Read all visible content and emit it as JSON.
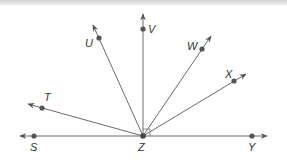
{
  "diagram": {
    "type": "rays-from-common-vertex",
    "vertex": {
      "label": "Z",
      "x": 143,
      "y": 136
    },
    "line": {
      "name": "line SY",
      "through": [
        "S",
        "Z",
        "Y"
      ]
    },
    "right_angle_marker": {
      "between": [
        "ZV",
        "ZY"
      ]
    },
    "rays": [
      {
        "name": "ray-ZS",
        "label": "S",
        "point": [
          34,
          136
        ],
        "tip": [
          20,
          136
        ],
        "label_pos": [
          30,
          151
        ]
      },
      {
        "name": "ray-ZT",
        "label": "T",
        "point": [
          42,
          108
        ],
        "tip": [
          28,
          104
        ],
        "label_pos": [
          44,
          101
        ]
      },
      {
        "name": "ray-ZU",
        "label": "U",
        "point": [
          99,
          38
        ],
        "tip": [
          93,
          25
        ],
        "label_pos": [
          85,
          47
        ]
      },
      {
        "name": "ray-ZV",
        "label": "V",
        "point": [
          143,
          29
        ],
        "tip": [
          143,
          14
        ],
        "label_pos": [
          148,
          33
        ]
      },
      {
        "name": "ray-ZW",
        "label": "W",
        "point": [
          202,
          49
        ],
        "tip": [
          211,
          36
        ],
        "label_pos": [
          187,
          50
        ]
      },
      {
        "name": "ray-ZX",
        "label": "X",
        "point": [
          234,
          81
        ],
        "tip": [
          246,
          74
        ],
        "label_pos": [
          225,
          78
        ]
      },
      {
        "name": "ray-ZY",
        "label": "Y",
        "point": [
          252,
          136
        ],
        "tip": [
          267,
          136
        ],
        "label_pos": [
          248,
          151
        ]
      }
    ],
    "labels": {
      "S": "S",
      "T": "T",
      "U": "U",
      "V": "V",
      "W": "W",
      "X": "X",
      "Y": "Y",
      "Z": "Z"
    },
    "colors": {
      "line": "#6a6a6a",
      "point": "#555555",
      "label": "#333333",
      "top_band": "#d4d4d4"
    }
  }
}
